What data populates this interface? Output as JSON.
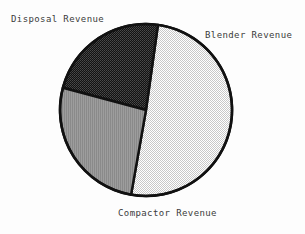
{
  "chart_data": {
    "type": "pie",
    "title": "",
    "labels": [
      "Disposal Revenue",
      "Blender Revenue",
      "Compactor Revenue"
    ],
    "values": [
      29,
      19,
      52
    ],
    "units": "percent",
    "legend_position": "callout-labels",
    "grid": false,
    "slices": [
      {
        "name": "Disposal Revenue",
        "value": 29,
        "fill_style": "light-dither",
        "color": "#d9d9d9",
        "start_angle_deg": 8,
        "end_angle_deg": 190
      },
      {
        "name": "Blender Revenue",
        "value": 19,
        "fill_style": "dark-dither",
        "color": "#2b2b2b",
        "start_angle_deg": 285,
        "end_angle_deg": 8
      },
      {
        "name": "Compactor Revenue",
        "value": 52,
        "fill_style": "vertical-stripe",
        "color": "#9a9a9a",
        "start_angle_deg": 190,
        "end_angle_deg": 285
      }
    ]
  },
  "labels": {
    "disposal": "Disposal Revenue",
    "blender": "Blender Revenue",
    "compactor": "Compactor Revenue"
  },
  "colors": {
    "disposal_fill": "#d9d9d9",
    "blender_fill": "#2b2b2b",
    "compactor_fill": "#9a9a9a",
    "outline": "#111111",
    "text": "#3b3b3b",
    "background": "#fdfdfd"
  },
  "geometry": {
    "center_x": 146,
    "center_y": 110,
    "radius": 86
  }
}
